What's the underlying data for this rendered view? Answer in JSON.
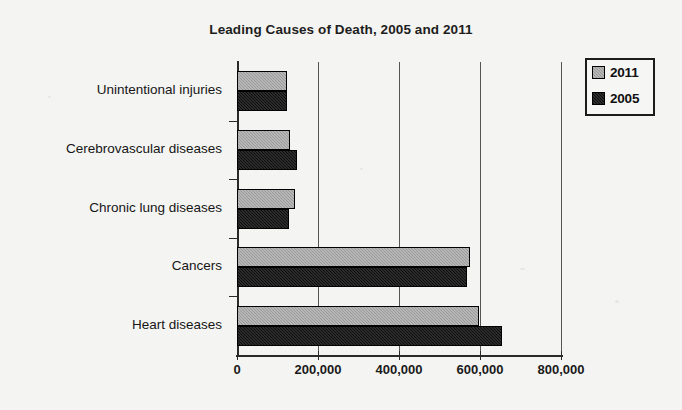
{
  "chart_data": {
    "type": "bar",
    "orientation": "horizontal",
    "title": "Leading Causes of Death, 2005 and 2011",
    "xlabel": "",
    "ylabel": "",
    "categories": [
      "Heart diseases",
      "Cancers",
      "Chronic lung diseases",
      "Cerebrovascular diseases",
      "Unintentional injuries"
    ],
    "series": [
      {
        "name": "2011",
        "color": "#9a9a9a",
        "values": [
          597000,
          575000,
          143000,
          130000,
          124000
        ]
      },
      {
        "name": "2005",
        "color": "#0d0d0d",
        "values": [
          655000,
          567000,
          129000,
          148000,
          123000
        ]
      }
    ],
    "xlim": [
      0,
      800000
    ],
    "xticks": [
      0,
      200000,
      400000,
      600000,
      800000
    ],
    "xtick_labels": [
      "0",
      "200,000",
      "400,000",
      "600,000",
      "800,000"
    ],
    "grid": "vertical",
    "legend_position": "top-right",
    "legend_entries": [
      "2011",
      "2005"
    ]
  }
}
